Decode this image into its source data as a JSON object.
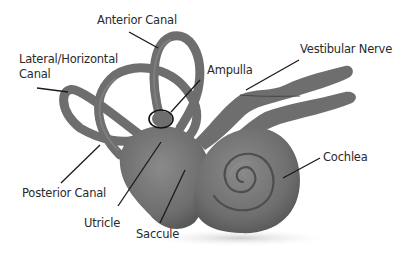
{
  "colors": {
    "structure": "#6e6e6e",
    "structure_dark": "#555555",
    "structure_light": "#8a8a8a",
    "leader_line": "#1a1a1a",
    "text": "#2a2a2a",
    "background": "#ffffff"
  },
  "labels": {
    "anterior_canal": "Anterior Canal",
    "lateral_canal_line1": "Lateral/Horizontal",
    "lateral_canal_line2": "Canal",
    "ampulla": "Ampulla",
    "vestibular_nerve": "Vestibular Nerve",
    "posterior_canal": "Posterior Canal",
    "utricle": "Utricle",
    "saccule": "Saccule",
    "cochlea": "Cochlea"
  }
}
